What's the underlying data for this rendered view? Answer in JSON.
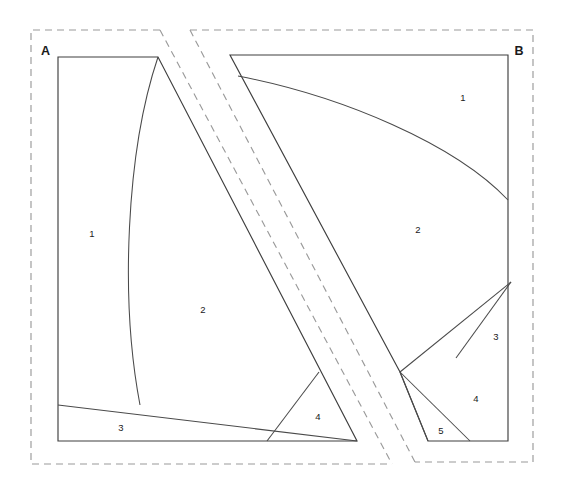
{
  "figure": {
    "background_color": "#ffffff",
    "solid_line_color": "#4a4a4a",
    "dashed_line_color": "#9a9a9a",
    "text_color": "#1a1a1a"
  },
  "panels": [
    {
      "id": "A",
      "label": "A",
      "label_position": {
        "x": 41,
        "y": 55
      },
      "dashed_boundary": "M 160 30 L 31 30 L 31 464 L 392 464",
      "regions": [
        {
          "number": "1",
          "label": "1",
          "x": 92,
          "y": 237
        },
        {
          "number": "2",
          "label": "2",
          "x": 203,
          "y": 313
        },
        {
          "number": "3",
          "label": "3",
          "x": 121,
          "y": 431
        },
        {
          "number": "4",
          "label": "4",
          "x": 318,
          "y": 420
        }
      ]
    },
    {
      "id": "B",
      "label": "B",
      "label_position": {
        "x": 519,
        "y": 55
      },
      "dashed_boundary": "M 190 30 L 533 30 L 533 462 L 415 462",
      "regions": [
        {
          "number": "1",
          "label": "1",
          "x": 463,
          "y": 101
        },
        {
          "number": "2",
          "label": "2",
          "x": 418,
          "y": 233
        },
        {
          "number": "3",
          "label": "3",
          "x": 496,
          "y": 340
        },
        {
          "number": "4",
          "label": "4",
          "x": 476,
          "y": 402
        },
        {
          "number": "5",
          "label": "5",
          "x": 441,
          "y": 434
        }
      ]
    }
  ],
  "dashed_diagonals": [
    {
      "name": "diagonal-left",
      "from": {
        "x": 160,
        "y": 30
      },
      "to": {
        "x": 392,
        "y": 464
      }
    },
    {
      "name": "diagonal-right",
      "from": {
        "x": 190,
        "y": 30
      },
      "to": {
        "x": 415,
        "y": 462
      }
    }
  ],
  "shapes": {
    "panel_a_outline": "M 58 57 L 158 57 L 357 441 L 58 441 Z",
    "panel_a_curve_1_2": "M 158 57 C 128 150 122 300 140 405",
    "panel_a_line_3_top": "M 58 405 L 357 441",
    "panel_a_region4_left": "M 267 441 L 319 372",
    "panel_a_region4_apex": "M 319 372 L 357 441",
    "panel_b_outline": "M 230 55 L 508 55 L 508 441 L 400 372 Z",
    "panel_b_curve_1_2": "M 238 76 C 330 92 450 140 508 200",
    "panel_b_line_2_3": "M 400 372 L 511 282",
    "panel_b_line_3_4": "M 456 358 L 511 282",
    "panel_b_line_4_5": "M 400 372 L 470 441",
    "panel_b_line_5_bottom": "M 400 372 L 428 441"
  }
}
